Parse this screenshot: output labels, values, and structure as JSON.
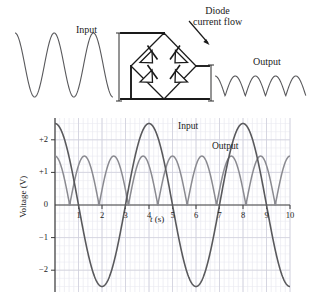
{
  "figure": {
    "title_labels": {
      "input_top": "Input",
      "output_top": "Output",
      "diode_line1": "Diode",
      "diode_line2": "current flow"
    },
    "circuit": {
      "name": "bridge-rectifier",
      "diode_count": 4,
      "description": "full-wave diode bridge"
    },
    "top_waveforms": {
      "input": {
        "type": "sine",
        "cycles": 2.5,
        "rectified": false
      },
      "output": {
        "type": "rectified-sine",
        "humps": 4.5,
        "rectified": true
      }
    }
  },
  "chart_data": {
    "type": "line",
    "title": "",
    "xlabel": "t (s)",
    "ylabel": "Voltage (V)",
    "xlim": [
      0,
      10
    ],
    "ylim": [
      -2.6,
      2.6
    ],
    "xticks": [
      1,
      2,
      3,
      4,
      5,
      6,
      7,
      8,
      9,
      10
    ],
    "xtick_labels": [
      "1",
      "2",
      "3",
      "4",
      "5",
      "6",
      "7",
      "8",
      "9",
      "10"
    ],
    "yticks": [
      2,
      1,
      0,
      -1,
      -2
    ],
    "ytick_labels": [
      "+2",
      "+1",
      "0",
      "−1",
      "−2"
    ],
    "grid": true,
    "grid_color": "#d8d8e0",
    "legend": "inline-annotations",
    "annotations": [
      {
        "text": "Input",
        "x": 5.7,
        "y": 2.35
      },
      {
        "text": "Output",
        "x": 7.0,
        "y": 1.75
      }
    ],
    "series": [
      {
        "name": "Input",
        "color": "#59595c",
        "kind": "sine",
        "amplitude": 2.5,
        "period": 4.0,
        "phase_deg": 90,
        "offset": 0,
        "note": "v = 2.5 cos(2*pi*t/4), starts at +2.5 at t=0"
      },
      {
        "name": "Output",
        "color": "#8a8a90",
        "kind": "rectified-sine-with-deadband",
        "amplitude": 1.5,
        "period": 2.5,
        "offset": 0,
        "note": "full-wave rectified sine clipped to zero near each input zero crossing; peaks at t=0,2.5,5,7.5,10; flat zero bands near t=1.3,3.8,6.3,8.8"
      }
    ],
    "x_samples": [
      0,
      0.5,
      1.0,
      1.25,
      1.5,
      2.0,
      2.5,
      3.0,
      3.5,
      3.75,
      4.0,
      4.5,
      5.0,
      5.5,
      6.0,
      6.25,
      6.5,
      7.0,
      7.5,
      8.0,
      8.5,
      8.75,
      9.0,
      9.5,
      10.0
    ],
    "input_values": [
      2.5,
      1.77,
      0.0,
      -0.96,
      -1.77,
      -2.5,
      -1.77,
      0.0,
      1.77,
      2.31,
      2.5,
      1.77,
      0.0,
      -1.77,
      -2.5,
      -2.31,
      -1.77,
      0.0,
      1.77,
      2.5,
      1.77,
      0.96,
      0.0,
      -1.77,
      2.5
    ],
    "output_values": [
      1.5,
      1.06,
      0.0,
      0.0,
      0.0,
      1.06,
      1.5,
      1.06,
      0.0,
      0.0,
      0.0,
      1.06,
      1.5,
      1.06,
      0.0,
      0.0,
      0.0,
      1.06,
      1.5,
      1.06,
      0.0,
      0.0,
      0.0,
      1.06,
      1.5
    ]
  }
}
